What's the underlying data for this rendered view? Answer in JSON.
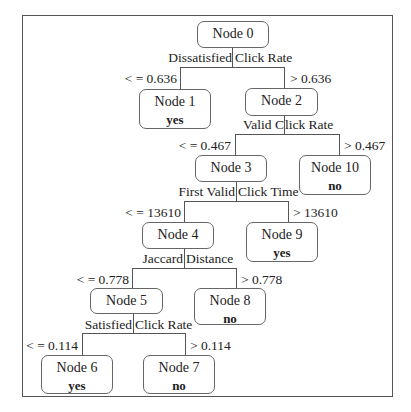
{
  "tree": {
    "nodes": {
      "n0": {
        "title": "Node 0",
        "class": ""
      },
      "n1": {
        "title": "Node 1",
        "class": "yes"
      },
      "n2": {
        "title": "Node 2",
        "class": ""
      },
      "n3": {
        "title": "Node 3",
        "class": ""
      },
      "n4": {
        "title": "Node 4",
        "class": ""
      },
      "n5": {
        "title": "Node 5",
        "class": ""
      },
      "n6": {
        "title": "Node 6",
        "class": "yes"
      },
      "n7": {
        "title": "Node 7",
        "class": "no"
      },
      "n8": {
        "title": "Node 8",
        "class": "no"
      },
      "n9": {
        "title": "Node 9",
        "class": "yes"
      },
      "n10": {
        "title": "Node 10",
        "class": "no"
      }
    },
    "splits": {
      "s0": {
        "feature_left": "Dissatisfied",
        "feature_right": "Click Rate",
        "left": "< = 0.636",
        "right": "> 0.636"
      },
      "s2": {
        "feature_left": "Valid C",
        "feature_right": "lick Rate",
        "left": "< = 0.467",
        "right": "> 0.467"
      },
      "s3": {
        "feature_left": "First Valid",
        "feature_right": "Click Time",
        "left": "< = 13610",
        "right": "> 13610"
      },
      "s4": {
        "feature_left": "Jaccard",
        "feature_right": "Distance",
        "left": "< = 0.778",
        "right": "> 0.778"
      },
      "s5": {
        "feature_left": "Satisfied",
        "feature_right": "Click Rate",
        "left": "< = 0.114",
        "right": "> 0.114"
      }
    }
  }
}
